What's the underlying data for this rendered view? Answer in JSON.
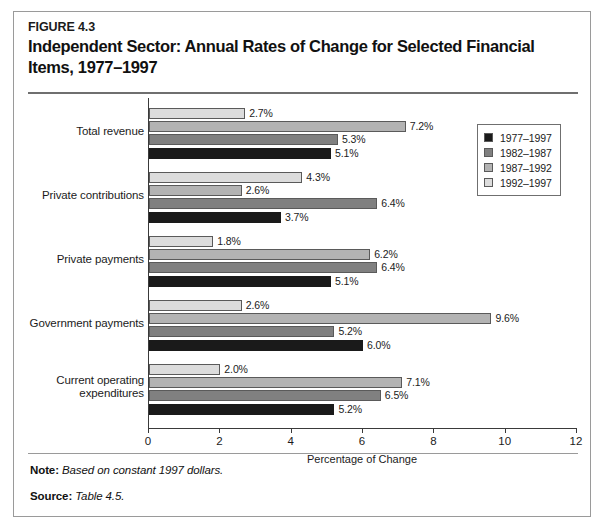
{
  "figure": {
    "number": "FIGURE 4.3",
    "title": "Independent Sector: Annual Rates of Change for Selected Financial Items, 1977–1997"
  },
  "footer": {
    "note_label": "Note:",
    "note_text": "Based on constant 1997 dollars.",
    "source_label": "Source:",
    "source_text": "Table 4.5."
  },
  "legend": {
    "items": [
      {
        "label": "1977–1997",
        "color": "#1a1a1a"
      },
      {
        "label": "1982–1987",
        "color": "#808080"
      },
      {
        "label": "1987–1992",
        "color": "#b3b3b3"
      },
      {
        "label": "1992–1997",
        "color": "#dcdcdc"
      }
    ]
  },
  "chart_data": {
    "type": "bar",
    "orientation": "horizontal",
    "title": "Independent Sector: Annual Rates of Change for Selected Financial Items, 1977–1997",
    "xlabel": "Percentage of Change",
    "ylabel": "",
    "xlim": [
      0,
      12
    ],
    "xticks": [
      0,
      2,
      4,
      6,
      8,
      10,
      12
    ],
    "xtick_labels": [
      "0",
      "2",
      "4",
      "6",
      "8",
      "10",
      "12"
    ],
    "grid": false,
    "legend_position": "top-right",
    "value_suffix": "%",
    "categories": [
      "Total revenue",
      "Private contributions",
      "Private payments",
      "Government payments",
      "Current operating expenditures"
    ],
    "series": [
      {
        "name": "1977–1997",
        "color": "#1a1a1a",
        "values": [
          5.1,
          3.7,
          5.1,
          6.0,
          5.2
        ]
      },
      {
        "name": "1982–1987",
        "color": "#808080",
        "values": [
          5.3,
          6.4,
          6.4,
          5.2,
          6.5
        ]
      },
      {
        "name": "1987–1992",
        "color": "#b3b3b3",
        "values": [
          7.2,
          2.6,
          6.2,
          9.6,
          7.1
        ]
      },
      {
        "name": "1992–1997",
        "color": "#dcdcdc",
        "values": [
          2.7,
          4.3,
          1.8,
          2.6,
          2.0
        ]
      }
    ],
    "value_labels": [
      [
        "5.1%",
        "5.3%",
        "7.2%",
        "2.7%"
      ],
      [
        "3.7%",
        "6.4%",
        "2.6%",
        "4.3%"
      ],
      [
        "5.1%",
        "6.4%",
        "6.2%",
        "1.8%"
      ],
      [
        "6.0%",
        "5.2%",
        "9.6%",
        "2.6%"
      ],
      [
        "5.2%",
        "6.5%",
        "7.1%",
        "2.0%"
      ]
    ]
  }
}
